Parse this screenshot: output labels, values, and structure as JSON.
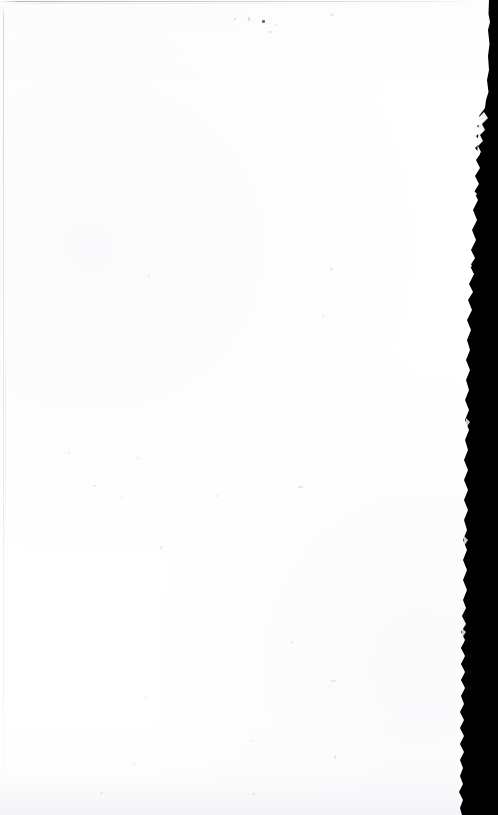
{
  "page": {
    "kind": "scanned-blank-page",
    "width": 498,
    "height": 815,
    "title": "",
    "body_text": "",
    "visible_text": "",
    "paper_color": "#ffffff",
    "edge_color": "#000000",
    "rule_color": "#8c8c94"
  },
  "regions": {
    "paper_label": "",
    "top_rule_label": "",
    "left_rule_label": "",
    "scan_edge_label": "",
    "bottom_shade_label": ""
  },
  "artifacts": {
    "specks": [
      {
        "x": 262,
        "y": 20,
        "w": 3,
        "h": 3,
        "class": "sq"
      },
      {
        "x": 234,
        "y": 18,
        "w": 2,
        "h": 2,
        "class": "faint"
      },
      {
        "x": 248,
        "y": 17,
        "w": 1.5,
        "h": 4,
        "class": "faint sq"
      },
      {
        "x": 275,
        "y": 24,
        "w": 2,
        "h": 2,
        "class": "vfaint"
      },
      {
        "x": 268,
        "y": 31,
        "w": 4,
        "h": 1.5,
        "class": "vfaint sq"
      },
      {
        "x": 330,
        "y": 13,
        "w": 4,
        "h": 3,
        "class": "vfaint"
      },
      {
        "x": 148,
        "y": 275,
        "w": 2,
        "h": 2,
        "class": "vfaint"
      },
      {
        "x": 330,
        "y": 268,
        "w": 2.5,
        "h": 2.5,
        "class": "vfaint"
      },
      {
        "x": 322,
        "y": 315,
        "w": 2,
        "h": 2,
        "class": "vfaint"
      },
      {
        "x": 68,
        "y": 452,
        "w": 2,
        "h": 2,
        "class": "vfaint"
      },
      {
        "x": 137,
        "y": 457,
        "w": 2,
        "h": 2,
        "class": "vfaint"
      },
      {
        "x": 93,
        "y": 485,
        "w": 3,
        "h": 2,
        "class": "vfaint"
      },
      {
        "x": 121,
        "y": 497,
        "w": 2,
        "h": 2,
        "class": "vfaint"
      },
      {
        "x": 216,
        "y": 495,
        "w": 2,
        "h": 2,
        "class": "vfaint"
      },
      {
        "x": 298,
        "y": 486,
        "w": 5,
        "h": 2,
        "class": "vfaint sq"
      },
      {
        "x": 160,
        "y": 546,
        "w": 3,
        "h": 3,
        "class": "vfaint"
      },
      {
        "x": 291,
        "y": 641,
        "w": 2,
        "h": 3,
        "class": "vfaint"
      },
      {
        "x": 331,
        "y": 680,
        "w": 5,
        "h": 2,
        "class": "vfaint sq"
      },
      {
        "x": 145,
        "y": 697,
        "w": 2,
        "h": 2,
        "class": "vfaint"
      },
      {
        "x": 250,
        "y": 740,
        "w": 2,
        "h": 2,
        "class": "vfaint"
      },
      {
        "x": 133,
        "y": 763,
        "w": 2,
        "h": 2,
        "class": "vfaint"
      },
      {
        "x": 334,
        "y": 755,
        "w": 2,
        "h": 4,
        "class": "vfaint sq"
      },
      {
        "x": 100,
        "y": 792,
        "w": 3,
        "h": 2,
        "class": "vfaint"
      },
      {
        "x": 252,
        "y": 793,
        "w": 3,
        "h": 2,
        "class": "vfaint"
      }
    ]
  }
}
